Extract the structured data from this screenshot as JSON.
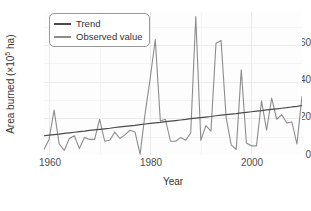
{
  "chart_data": {
    "type": "line",
    "title": "",
    "xlabel": "Year",
    "ylabel": "Area burned (×10⁵ ha)",
    "ylabel_prefix": "Area burned (×10",
    "ylabel_exponent": "5",
    "ylabel_suffix": " ha)",
    "xlim": [
      1959,
      2010
    ],
    "ylim": [
      0,
      78
    ],
    "xticks": [
      1960,
      1980,
      2000
    ],
    "xticklabels": [
      "1960",
      "1980",
      "2000"
    ],
    "yticks": [
      0,
      20,
      40,
      60
    ],
    "yticklabels": [
      "0",
      "20",
      "40",
      "60"
    ],
    "grid": true,
    "legend_position": "upper-left-inside",
    "colors": {
      "trend": "#4a4a4a",
      "observed": "#8c8c8c",
      "panel_background": "#fdfdfd",
      "gridline": "#ebebeb",
      "axis_text": "#4d4d4d",
      "legend_border": "#9a9a9a"
    },
    "x": [
      1959,
      1960,
      1961,
      1962,
      1963,
      1964,
      1965,
      1966,
      1967,
      1968,
      1969,
      1970,
      1971,
      1972,
      1973,
      1974,
      1975,
      1976,
      1977,
      1978,
      1979,
      1980,
      1981,
      1982,
      1983,
      1984,
      1985,
      1986,
      1987,
      1988,
      1989,
      1990,
      1991,
      1992,
      1993,
      1994,
      1995,
      1996,
      1997,
      1998,
      1999,
      2000,
      2001,
      2002,
      2003,
      2004,
      2005,
      2006,
      2007,
      2008,
      2009,
      2010
    ],
    "series": [
      {
        "name": "Trend",
        "type": "line",
        "color": "#4a4a4a",
        "values": [
          10.5,
          10.8,
          11.1,
          11.4,
          11.8,
          12.1,
          12.4,
          12.7,
          13.0,
          13.4,
          13.7,
          14.0,
          14.3,
          14.6,
          15.0,
          15.3,
          15.6,
          15.9,
          16.2,
          16.6,
          16.9,
          17.2,
          17.5,
          17.8,
          18.2,
          18.5,
          18.8,
          19.1,
          19.4,
          19.8,
          20.1,
          20.4,
          20.7,
          21.0,
          21.4,
          21.7,
          22.0,
          22.3,
          22.6,
          23.0,
          23.3,
          23.6,
          23.9,
          24.2,
          24.6,
          24.9,
          25.2,
          25.5,
          25.8,
          26.2,
          26.5,
          27.0
        ]
      },
      {
        "name": "Observed value",
        "type": "line",
        "color": "#8c8c8c",
        "values": [
          3.0,
          8.5,
          24.5,
          6.0,
          2.5,
          9.0,
          10.5,
          3.5,
          9.5,
          8.5,
          8.5,
          19.5,
          7.5,
          8.0,
          12.5,
          9.0,
          11.0,
          13.5,
          12.5,
          0.5,
          23.0,
          42.0,
          63.0,
          18.5,
          19.5,
          7.5,
          7.5,
          9.5,
          8.0,
          12.0,
          75.5,
          8.0,
          16.0,
          13.0,
          61.0,
          62.5,
          20.5,
          5.5,
          3.0,
          46.5,
          6.5,
          5.0,
          5.0,
          29.5,
          13.5,
          31.0,
          19.5,
          22.0,
          17.5,
          18.0,
          6.0,
          32.0
        ]
      }
    ]
  },
  "legend": {
    "items": [
      {
        "label": "Trend",
        "color": "#4a4a4a"
      },
      {
        "label": "Observed value",
        "color": "#8c8c8c"
      }
    ]
  },
  "axes": {
    "ytick_0": "0",
    "ytick_1": "20",
    "ytick_2": "40",
    "ytick_3": "60",
    "xtick_0": "1960",
    "xtick_1": "1980",
    "xtick_2": "2000"
  }
}
